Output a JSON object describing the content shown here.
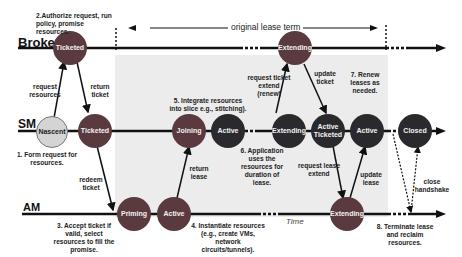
{
  "lanes": {
    "broker": "Broker",
    "sm": "SM",
    "am": "AM"
  },
  "lease_term_label": "original lease term",
  "time_label": "Time",
  "nodes": {
    "broker_ticketed": "Ticketed",
    "broker_extending": "Extending",
    "sm_nascent": "Nascent",
    "sm_ticketed": "Ticketed",
    "sm_joining": "Joining",
    "sm_active": "Active",
    "sm_extending": "Extending",
    "sm_active_ticketed": "Active Ticketed",
    "sm_active2": "Active",
    "sm_closed": "Closed",
    "am_priming": "Priming",
    "am_active": "Active",
    "am_extending": "Extending"
  },
  "annotations": {
    "step1": "1. Form request for resources.",
    "step2": "2.Authorize request, run policy, promise resources.",
    "step3": "3. Accept ticket if valid, select resources to fill the promise.",
    "step4": "4. Instantiate resources (e.g., create VMs, network circuits/tunnels).",
    "step5": "5. Integrate resources into slice e.g., stitching).",
    "step6": "6. Application uses the resources for duration of lease.",
    "step7": "7. Renew leases as needed.",
    "step8": "8. Terminate lease and reclaim resources."
  },
  "arrows": {
    "request_resources": "request resources",
    "return_ticket": "return ticket",
    "redeem_ticket": "redeem ticket",
    "return_lease": "return lease",
    "request_ticket_extend": "request ticket extend (renew)",
    "update_ticket": "update ticket",
    "request_lease_extend": "request lease extend",
    "update_lease": "update lease",
    "close_handshake": "close handshake"
  },
  "colors": {
    "dark_node": "#2a2a2e",
    "red_node": "#5a3a3e",
    "light_node": "#d4d4d4",
    "shade": "#ececec"
  }
}
